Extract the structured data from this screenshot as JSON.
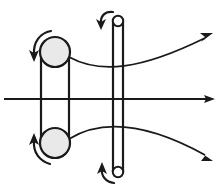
{
  "figure": {
    "canvas": {
      "width": 221,
      "height": 195,
      "background": "#ffffff"
    },
    "colors": {
      "line": "#1a1a1a",
      "pulley_fill": "#e9e9e9",
      "roller_fill": "#ffffff",
      "background": "#ffffff"
    }
  },
  "components": {
    "pulley_top_left": {
      "label": "upper drive pulley",
      "cx": 55,
      "cy": 52,
      "r": 15,
      "fill": "#e9e9e9",
      "stroke_width": 2.2
    },
    "pulley_bottom_left": {
      "label": "lower drive pulley",
      "cx": 55,
      "cy": 143,
      "r": 15,
      "fill": "#e9e9e9",
      "stroke_width": 2.2
    },
    "roller_top_cap": {
      "label": "upper roller end",
      "cx": 118,
      "cy": 21,
      "r": 5.2,
      "fill": "#ffffff",
      "stroke_width": 2.0
    },
    "roller_bottom_cap": {
      "label": "lower roller end",
      "cx": 118,
      "cy": 172,
      "r": 5.2,
      "fill": "#ffffff",
      "stroke_width": 2.0
    },
    "belt": {
      "label": "drive belt spanning the two left pulleys",
      "left_x": 41,
      "right_x": 69,
      "top_y": 52,
      "bottom_y": 143,
      "stroke_width": 2.2
    },
    "roller_shaft": {
      "label": "vertical roller shaft",
      "left_x": 113,
      "right_x": 123,
      "top_y": 21,
      "bottom_y": 172,
      "stroke_width": 2.2
    }
  },
  "arrows": {
    "axis": {
      "label": "central horizontal axis arrow",
      "from_x": 4,
      "to_x": 214,
      "y": 99,
      "stroke_width": 2.0,
      "direction": "right"
    },
    "curve_upper": {
      "label": "upper diverging path arrow",
      "start_x": 69,
      "start_y": 57,
      "end_x": 211,
      "end_y": 34,
      "direction": "up-right",
      "stroke_width": 1.8
    },
    "curve_lower": {
      "label": "lower diverging path arrow",
      "start_x": 69,
      "start_y": 139,
      "end_x": 211,
      "end_y": 159,
      "direction": "down-right",
      "stroke_width": 1.8
    },
    "rotation": [
      {
        "id": "rot-top-left",
        "label": "counterclockwise rotation at upper drive pulley",
        "pivot_x": 55,
        "pivot_y": 52,
        "sense": "counterclockwise",
        "stroke_width": 2.2
      },
      {
        "id": "rot-bottom-left",
        "label": "counterclockwise rotation at lower drive pulley",
        "pivot_x": 55,
        "pivot_y": 143,
        "sense": "counterclockwise",
        "stroke_width": 2.2
      },
      {
        "id": "rot-top-right",
        "label": "counterclockwise rotation at upper roller end",
        "pivot_x": 118,
        "pivot_y": 21,
        "sense": "counterclockwise",
        "stroke_width": 2.2
      },
      {
        "id": "rot-bottom-right",
        "label": "counterclockwise rotation at lower roller end",
        "pivot_x": 118,
        "pivot_y": 172,
        "sense": "counterclockwise",
        "stroke_width": 2.2
      }
    ]
  }
}
